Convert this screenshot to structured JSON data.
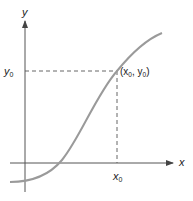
{
  "diagram": {
    "type": "function-graph",
    "axes": {
      "x_label": "x",
      "y_label": "y"
    },
    "point": {
      "label_open": "(x",
      "label_sub1": "0",
      "label_mid": ", y",
      "label_sub2": "0",
      "label_close": ")"
    },
    "ticks": {
      "x0_base": "x",
      "x0_sub": "0",
      "y0_base": "y",
      "y0_sub": "0"
    },
    "colors": {
      "axis": "#555555",
      "curve": "#9a9a9a",
      "dashed": "#555555",
      "text": "#222222"
    }
  }
}
